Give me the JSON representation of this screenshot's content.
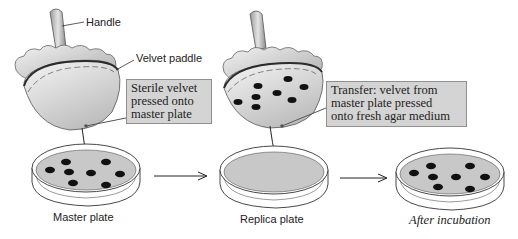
{
  "labels": {
    "handle": "Handle",
    "velvet_paddle": "Velvet paddle"
  },
  "callouts": {
    "sterile": [
      "Sterile velvet",
      "pressed onto",
      "master plate"
    ],
    "transfer": [
      "Transfer: velvet from",
      "master plate pressed",
      "onto fresh agar medium"
    ]
  },
  "captions": {
    "master": "Master plate",
    "replica": "Replica plate",
    "after": "After incubation"
  },
  "colors": {
    "callout_bg": "#d4d4d4",
    "agar": "#c8c8c8",
    "paddle": "#cfcfcf",
    "colony": "#111111"
  }
}
